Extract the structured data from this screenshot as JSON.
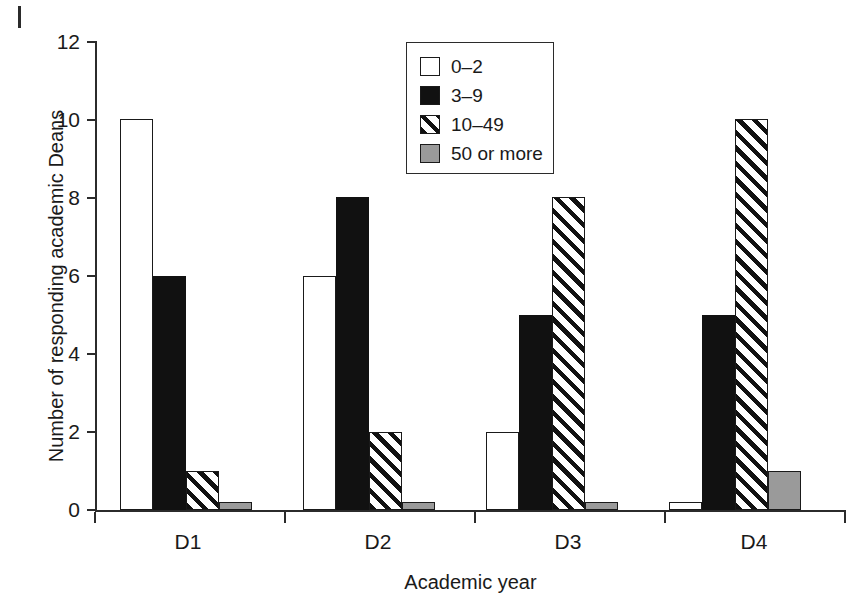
{
  "chart_data": {
    "type": "bar",
    "title": "",
    "subtitle": "",
    "xlabel": "Academic year",
    "ylabel": "Number of responding academic Deans",
    "categories": [
      "D1",
      "D2",
      "D3",
      "D4"
    ],
    "ylim": [
      0,
      12
    ],
    "yticks": [
      0,
      2,
      4,
      6,
      8,
      10,
      12
    ],
    "ytick_labels": [
      "0",
      "2",
      "4",
      "6",
      "8",
      "10",
      "12"
    ],
    "grid": false,
    "legend_position": "top-center-right",
    "series": [
      {
        "name": "0–2",
        "pattern": "empty",
        "color": "#ffffff",
        "values": [
          10,
          6,
          2,
          0.2
        ]
      },
      {
        "name": "3–9",
        "pattern": "solid",
        "color": "#111111",
        "values": [
          6,
          8,
          5,
          5
        ]
      },
      {
        "name": "10–49",
        "pattern": "hatch",
        "color": "#111111",
        "values": [
          1,
          2,
          8,
          10
        ]
      },
      {
        "name": "50 or more",
        "pattern": "gray",
        "color": "#9a9a9a",
        "values": [
          0.2,
          0.2,
          0.2,
          1
        ]
      }
    ]
  },
  "axes": {
    "y_title": "Number of responding academic Deans",
    "x_title": "Academic year",
    "y_tick_labels": [
      "12",
      "10",
      "8",
      "6",
      "4",
      "2",
      "0"
    ],
    "x_tick_labels": [
      "D1",
      "D2",
      "D3",
      "D4"
    ]
  },
  "legend": {
    "items": [
      {
        "label": "0–2"
      },
      {
        "label": "3–9"
      },
      {
        "label": "10–49"
      },
      {
        "label": "50 or more"
      }
    ]
  }
}
